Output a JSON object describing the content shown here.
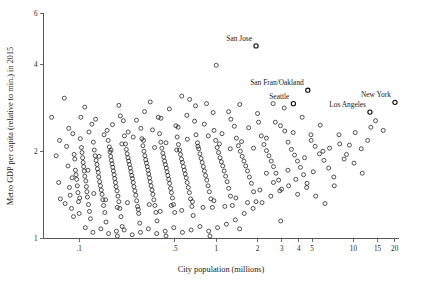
{
  "chart_data": {
    "type": "scatter",
    "title": "",
    "xlabel": "City population (millions)",
    "ylabel": "Metro GDP per capita (relative to min.) in 2015",
    "xscale": "log",
    "yscale": "log",
    "xlim": [
      0.055,
      21.5
    ],
    "ylim": [
      1.0,
      6.0
    ],
    "grid": false,
    "legend": null,
    "xticks": [
      0.1,
      0.5,
      1,
      2,
      3,
      4,
      5,
      10,
      15,
      20
    ],
    "xtick_labels": [
      ".1",
      ".5",
      "1",
      "2",
      "3",
      "4",
      "5",
      "10",
      "15",
      "20"
    ],
    "yticks": [
      1,
      2,
      4,
      6
    ],
    "ytick_labels": [
      "1",
      "2",
      "4",
      "6"
    ],
    "marker": "open-circle",
    "marker_color": "#1c1c1c",
    "annotations": [
      {
        "label": "San Jose",
        "x": 1.95,
        "y": 4.62
      },
      {
        "label": "San Fran/Oakland",
        "x": 4.65,
        "y": 3.25
      },
      {
        "label": "Seattle",
        "x": 3.65,
        "y": 2.92
      },
      {
        "label": "Los Angeles",
        "x": 13.2,
        "y": 2.73
      },
      {
        "label": "New York",
        "x": 20.1,
        "y": 2.95
      }
    ],
    "points": [
      [
        0.063,
        2.62
      ],
      [
        0.068,
        1.93
      ],
      [
        0.071,
        1.56
      ],
      [
        0.073,
        1.37
      ],
      [
        0.078,
        3.05
      ],
      [
        0.081,
        2.08
      ],
      [
        0.083,
        1.78
      ],
      [
        0.085,
        1.5
      ],
      [
        0.086,
        1.41
      ],
      [
        0.088,
        1.27
      ],
      [
        0.09,
        2.3
      ],
      [
        0.092,
        1.95
      ],
      [
        0.093,
        1.88
      ],
      [
        0.094,
        1.72
      ],
      [
        0.095,
        1.66
      ],
      [
        0.096,
        1.6
      ],
      [
        0.097,
        1.52
      ],
      [
        0.098,
        1.44
      ],
      [
        0.099,
        1.34
      ],
      [
        0.1,
        1.22
      ],
      [
        0.102,
        2.21
      ],
      [
        0.104,
        2.06
      ],
      [
        0.105,
        1.98
      ],
      [
        0.106,
        1.9
      ],
      [
        0.107,
        1.83
      ],
      [
        0.108,
        1.77
      ],
      [
        0.109,
        1.71
      ],
      [
        0.11,
        1.64
      ],
      [
        0.112,
        1.58
      ],
      [
        0.113,
        1.51
      ],
      [
        0.114,
        1.45
      ],
      [
        0.115,
        1.39
      ],
      [
        0.117,
        1.31
      ],
      [
        0.119,
        1.24
      ],
      [
        0.121,
        1.17
      ],
      [
        0.124,
        2.48
      ],
      [
        0.127,
        2.15
      ],
      [
        0.129,
        2.02
      ],
      [
        0.131,
        1.93
      ],
      [
        0.133,
        1.86
      ],
      [
        0.135,
        1.8
      ],
      [
        0.136,
        1.74
      ],
      [
        0.138,
        1.69
      ],
      [
        0.139,
        1.63
      ],
      [
        0.141,
        1.57
      ],
      [
        0.143,
        1.52
      ],
      [
        0.145,
        1.47
      ],
      [
        0.147,
        1.42
      ],
      [
        0.149,
        1.36
      ],
      [
        0.151,
        1.3
      ],
      [
        0.154,
        1.23
      ],
      [
        0.157,
        1.14
      ],
      [
        0.16,
        2.36
      ],
      [
        0.163,
        2.18
      ],
      [
        0.166,
        2.07
      ],
      [
        0.168,
        1.99
      ],
      [
        0.17,
        1.92
      ],
      [
        0.172,
        1.86
      ],
      [
        0.174,
        1.81
      ],
      [
        0.176,
        1.76
      ],
      [
        0.178,
        1.71
      ],
      [
        0.18,
        1.66
      ],
      [
        0.182,
        1.61
      ],
      [
        0.184,
        1.56
      ],
      [
        0.186,
        1.51
      ],
      [
        0.189,
        1.46
      ],
      [
        0.192,
        1.4
      ],
      [
        0.195,
        1.34
      ],
      [
        0.198,
        1.27
      ],
      [
        0.202,
        1.19
      ],
      [
        0.206,
        1.1
      ],
      [
        0.21,
        2.55
      ],
      [
        0.214,
        2.26
      ],
      [
        0.218,
        2.12
      ],
      [
        0.221,
        2.03
      ],
      [
        0.224,
        1.96
      ],
      [
        0.227,
        1.9
      ],
      [
        0.23,
        1.85
      ],
      [
        0.233,
        1.8
      ],
      [
        0.236,
        1.75
      ],
      [
        0.239,
        1.7
      ],
      [
        0.242,
        1.65
      ],
      [
        0.245,
        1.61
      ],
      [
        0.248,
        1.56
      ],
      [
        0.251,
        1.51
      ],
      [
        0.255,
        1.46
      ],
      [
        0.259,
        1.41
      ],
      [
        0.263,
        1.35
      ],
      [
        0.267,
        1.29
      ],
      [
        0.272,
        1.22
      ],
      [
        0.277,
        1.13
      ],
      [
        0.282,
        2.4
      ],
      [
        0.287,
        2.21
      ],
      [
        0.292,
        2.09
      ],
      [
        0.297,
        2.0
      ],
      [
        0.302,
        1.93
      ],
      [
        0.306,
        1.87
      ],
      [
        0.31,
        1.82
      ],
      [
        0.314,
        1.77
      ],
      [
        0.318,
        1.72
      ],
      [
        0.322,
        1.67
      ],
      [
        0.326,
        1.62
      ],
      [
        0.33,
        1.57
      ],
      [
        0.335,
        1.52
      ],
      [
        0.34,
        1.47
      ],
      [
        0.345,
        1.42
      ],
      [
        0.351,
        1.36
      ],
      [
        0.357,
        1.3
      ],
      [
        0.363,
        1.23
      ],
      [
        0.37,
        1.15
      ],
      [
        0.378,
        2.62
      ],
      [
        0.386,
        2.3
      ],
      [
        0.394,
        2.15
      ],
      [
        0.401,
        2.05
      ],
      [
        0.408,
        1.97
      ],
      [
        0.414,
        1.91
      ],
      [
        0.42,
        1.85
      ],
      [
        0.426,
        1.8
      ],
      [
        0.432,
        1.75
      ],
      [
        0.438,
        1.7
      ],
      [
        0.444,
        1.65
      ],
      [
        0.45,
        1.6
      ],
      [
        0.457,
        1.55
      ],
      [
        0.464,
        1.49
      ],
      [
        0.471,
        1.44
      ],
      [
        0.479,
        1.38
      ],
      [
        0.488,
        1.31
      ],
      [
        0.498,
        1.23
      ],
      [
        0.508,
        2.45
      ],
      [
        0.519,
        2.24
      ],
      [
        0.53,
        2.11
      ],
      [
        0.54,
        2.02
      ],
      [
        0.549,
        1.95
      ],
      [
        0.558,
        1.88
      ],
      [
        0.567,
        1.83
      ],
      [
        0.576,
        1.77
      ],
      [
        0.585,
        1.72
      ],
      [
        0.594,
        1.67
      ],
      [
        0.604,
        1.62
      ],
      [
        0.614,
        1.56
      ],
      [
        0.625,
        1.5
      ],
      [
        0.637,
        1.44
      ],
      [
        0.65,
        1.37
      ],
      [
        0.664,
        1.29
      ],
      [
        0.679,
        1.2
      ],
      [
        0.695,
        2.54
      ],
      [
        0.712,
        2.28
      ],
      [
        0.729,
        2.14
      ],
      [
        0.745,
        2.04
      ],
      [
        0.76,
        1.96
      ],
      [
        0.775,
        1.89
      ],
      [
        0.79,
        1.83
      ],
      [
        0.805,
        1.77
      ],
      [
        0.82,
        1.71
      ],
      [
        0.836,
        1.65
      ],
      [
        0.853,
        1.59
      ],
      [
        0.871,
        1.52
      ],
      [
        0.891,
        1.45
      ],
      [
        0.913,
        1.37
      ],
      [
        0.937,
        1.28
      ],
      [
        0.963,
        2.36
      ],
      [
        0.99,
        2.18
      ],
      [
        1.015,
        2.06
      ],
      [
        1.04,
        1.98
      ],
      [
        1.065,
        1.9
      ],
      [
        1.09,
        1.84
      ],
      [
        1.115,
        1.78
      ],
      [
        1.142,
        1.71
      ],
      [
        1.17,
        1.64
      ],
      [
        1.2,
        1.57
      ],
      [
        1.233,
        1.49
      ],
      [
        1.27,
        1.4
      ],
      [
        1.31,
        1.3
      ],
      [
        1.355,
        2.44
      ],
      [
        1.402,
        2.22
      ],
      [
        1.45,
        2.09
      ],
      [
        1.498,
        2.0
      ],
      [
        1.545,
        1.92
      ],
      [
        1.592,
        1.85
      ],
      [
        1.64,
        1.78
      ],
      [
        1.69,
        1.71
      ],
      [
        1.745,
        1.63
      ],
      [
        1.805,
        1.55
      ],
      [
        1.872,
        1.45
      ],
      [
        1.948,
        1.34
      ],
      [
        2.035,
        2.52
      ],
      [
        2.13,
        2.26
      ],
      [
        2.228,
        2.11
      ],
      [
        2.325,
        2.01
      ],
      [
        2.42,
        1.93
      ],
      [
        2.515,
        1.85
      ],
      [
        2.615,
        1.77
      ],
      [
        2.725,
        1.68
      ],
      [
        2.85,
        1.59
      ],
      [
        2.995,
        1.48
      ],
      [
        3.16,
        2.35
      ],
      [
        3.34,
        2.15
      ],
      [
        3.53,
        2.03
      ],
      [
        3.72,
        1.94
      ],
      [
        3.91,
        1.85
      ],
      [
        4.11,
        1.76
      ],
      [
        4.33,
        1.66
      ],
      [
        4.59,
        1.55
      ],
      [
        4.9,
        2.28
      ],
      [
        5.26,
        2.08
      ],
      [
        5.66,
        1.96
      ],
      [
        6.1,
        1.86
      ],
      [
        6.6,
        1.75
      ],
      [
        7.2,
        1.63
      ],
      [
        7.95,
        2.12
      ],
      [
        8.9,
        1.95
      ],
      [
        10.1,
        1.82
      ],
      [
        11.6,
        1.68
      ],
      [
        13.4,
        2.42
      ],
      [
        0.072,
        2.18
      ],
      [
        0.084,
        2.4
      ],
      [
        0.091,
        1.19
      ],
      [
        0.103,
        2.62
      ],
      [
        0.111,
        1.09
      ],
      [
        0.118,
        2.33
      ],
      [
        0.126,
        1.05
      ],
      [
        0.132,
        2.58
      ],
      [
        0.144,
        1.08
      ],
      [
        0.152,
        2.28
      ],
      [
        0.164,
        1.04
      ],
      [
        0.175,
        2.47
      ],
      [
        0.187,
        1.06
      ],
      [
        0.2,
        2.65
      ],
      [
        0.213,
        1.07
      ],
      [
        0.228,
        2.33
      ],
      [
        0.244,
        1.03
      ],
      [
        0.262,
        2.56
      ],
      [
        0.28,
        1.05
      ],
      [
        0.3,
        2.74
      ],
      [
        0.32,
        1.08
      ],
      [
        0.343,
        2.37
      ],
      [
        0.368,
        1.04
      ],
      [
        0.395,
        2.6
      ],
      [
        0.424,
        1.06
      ],
      [
        0.455,
        2.8
      ],
      [
        0.49,
        1.09
      ],
      [
        0.527,
        2.42
      ],
      [
        0.567,
        1.05
      ],
      [
        0.61,
        2.66
      ],
      [
        0.656,
        1.07
      ],
      [
        0.706,
        2.87
      ],
      [
        0.76,
        1.1
      ],
      [
        0.818,
        2.48
      ],
      [
        0.881,
        1.06
      ],
      [
        0.949,
        2.72
      ],
      [
        1.022,
        1.09
      ],
      [
        1.101,
        2.3
      ],
      [
        1.186,
        1.12
      ],
      [
        1.278,
        2.58
      ],
      [
        1.377,
        1.16
      ],
      [
        1.484,
        2.9
      ],
      [
        1.599,
        1.22
      ],
      [
        1.723,
        2.41
      ],
      [
        1.856,
        1.27
      ],
      [
        2.0,
        2.7
      ],
      [
        2.155,
        1.33
      ],
      [
        2.322,
        2.22
      ],
      [
        2.5,
        1.4
      ],
      [
        2.695,
        2.52
      ],
      [
        2.905,
        1.46
      ],
      [
        3.13,
        2.82
      ],
      [
        3.37,
        1.52
      ],
      [
        3.64,
        2.32
      ],
      [
        3.92,
        1.42
      ],
      [
        4.23,
        2.62
      ],
      [
        4.56,
        1.5
      ],
      [
        4.92,
        2.18
      ],
      [
        5.31,
        1.4
      ],
      [
        5.73,
        2.46
      ],
      [
        6.2,
        1.32
      ],
      [
        6.7,
        2.05
      ],
      [
        7.25,
        1.52
      ],
      [
        7.85,
        2.28
      ],
      [
        8.55,
        1.88
      ],
      [
        9.35,
        2.1
      ],
      [
        10.3,
        2.32
      ],
      [
        11.4,
        2.04
      ],
      [
        12.7,
        2.18
      ],
      [
        14.5,
        2.55
      ],
      [
        16.5,
        2.36
      ],
      [
        0.079,
        1.32
      ],
      [
        0.089,
        1.62
      ],
      [
        0.101,
        1.38
      ],
      [
        0.116,
        1.72
      ],
      [
        0.128,
        1.43
      ],
      [
        0.14,
        1.92
      ],
      [
        0.156,
        1.36
      ],
      [
        0.171,
        2.02
      ],
      [
        0.19,
        1.28
      ],
      [
        0.205,
        2.12
      ],
      [
        0.225,
        1.33
      ],
      [
        0.248,
        2.24
      ],
      [
        0.27,
        1.26
      ],
      [
        0.295,
        2.18
      ],
      [
        0.325,
        1.31
      ],
      [
        0.355,
        2.06
      ],
      [
        0.39,
        1.24
      ],
      [
        0.43,
        2.14
      ],
      [
        0.47,
        1.3
      ],
      [
        0.515,
        2.02
      ],
      [
        0.56,
        1.25
      ],
      [
        0.615,
        2.2
      ],
      [
        0.67,
        1.34
      ],
      [
        0.735,
        2.08
      ],
      [
        0.8,
        1.28
      ],
      [
        0.875,
        2.26
      ],
      [
        0.96,
        1.35
      ],
      [
        1.055,
        2.12
      ],
      [
        1.155,
        1.29
      ],
      [
        1.265,
        2.04
      ],
      [
        1.39,
        1.38
      ],
      [
        1.53,
        2.16
      ],
      [
        1.69,
        1.33
      ],
      [
        1.87,
        2.05
      ],
      [
        2.08,
        1.47
      ],
      [
        2.32,
        1.68
      ],
      [
        2.61,
        1.56
      ],
      [
        2.94,
        2.45
      ],
      [
        3.33,
        1.72
      ],
      [
        3.8,
        1.6
      ],
      [
        4.4,
        1.9
      ],
      [
        5.1,
        1.7
      ],
      [
        6.0,
        2.0
      ],
      [
        1.0,
        3.96
      ],
      [
        0.85,
        2.92
      ],
      [
        1.23,
        2.74
      ],
      [
        0.64,
        3.02
      ],
      [
        0.33,
        2.96
      ],
      [
        0.195,
        2.88
      ],
      [
        0.11,
        2.84
      ],
      [
        2.6,
        2.92
      ],
      [
        1.48,
        1.08
      ],
      [
        0.9,
        1.02
      ],
      [
        0.43,
        1.02
      ],
      [
        0.19,
        1.02
      ],
      [
        2.95,
        1.15
      ],
      [
        0.56,
        3.1
      ]
    ]
  }
}
